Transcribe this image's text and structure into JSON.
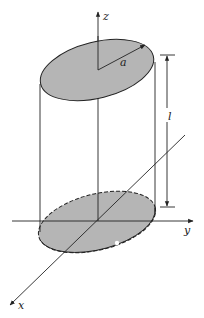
{
  "diagram": {
    "labels": {
      "z_axis": "z",
      "y_axis": "y",
      "x_axis": "x",
      "radius": "a",
      "length": "l"
    },
    "colors": {
      "disk_fill": "#b5b5b5",
      "stroke": "#222222",
      "background": "#ffffff"
    }
  }
}
